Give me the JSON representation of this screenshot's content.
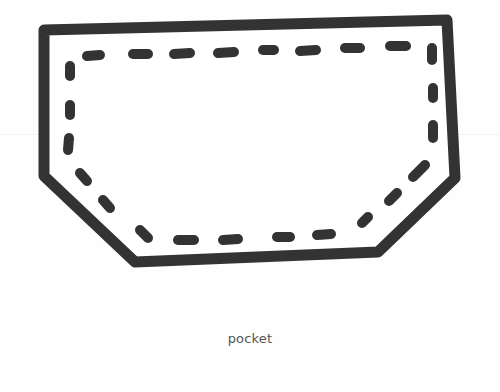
{
  "caption": "pocket",
  "colors": {
    "ink": "#333333",
    "paper": "#fefefe",
    "caption": "#555555"
  },
  "shape": {
    "outline_points": "44,30 447,20 455,178 378,252 135,262 44,176",
    "stitch_points": "70,55 430,45 434,160 388,205 360,228 135,232 70,175"
  }
}
